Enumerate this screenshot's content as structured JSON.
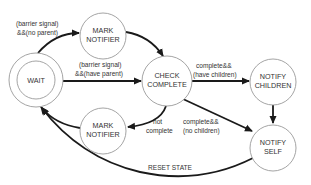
{
  "diagram": {
    "type": "state-machine",
    "states": [
      {
        "id": "wait",
        "lines": [
          "WAIT"
        ],
        "initial": true
      },
      {
        "id": "mark_notifier_top",
        "lines": [
          "MARK",
          "NOTIFIER"
        ]
      },
      {
        "id": "check_complete",
        "lines": [
          "CHECK",
          "COMPLETE"
        ]
      },
      {
        "id": "notify_children",
        "lines": [
          "NOTIFY",
          "CHILDREN"
        ]
      },
      {
        "id": "mark_notifier_bottom",
        "lines": [
          "MARK",
          "NOTIFIER"
        ]
      },
      {
        "id": "notify_self",
        "lines": [
          "NOTIFY",
          "SELF"
        ]
      }
    ],
    "transitions": [
      {
        "from": "wait",
        "to": "mark_notifier_top",
        "lines": [
          "(barrier signal)",
          "&&(no parent)"
        ]
      },
      {
        "from": "mark_notifier_top",
        "to": "check_complete",
        "lines": []
      },
      {
        "from": "wait",
        "to": "check_complete",
        "lines": [
          "(barrier signal)",
          "&&(have parent)"
        ]
      },
      {
        "from": "check_complete",
        "to": "notify_children",
        "lines": [
          "complete&&",
          "(have children)"
        ]
      },
      {
        "from": "notify_children",
        "to": "notify_self",
        "lines": []
      },
      {
        "from": "check_complete",
        "to": "notify_self",
        "lines": [
          "complete&&",
          "(no children)"
        ]
      },
      {
        "from": "check_complete",
        "to": "mark_notifier_bottom",
        "lines": [
          "not",
          "complete"
        ]
      },
      {
        "from": "mark_notifier_bottom",
        "to": "wait",
        "lines": []
      },
      {
        "from": "notify_self",
        "to": "wait",
        "lines": [
          "RESET STATE"
        ]
      }
    ]
  }
}
